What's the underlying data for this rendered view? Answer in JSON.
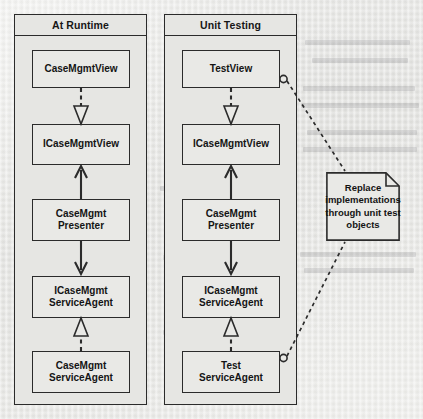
{
  "diagram": {
    "type": "uml-class-diagram",
    "background_color": "#ebebe8",
    "line_color": "#2b2b2b",
    "box_fill": "#e9e9e6",
    "packages": [
      {
        "id": "at-runtime",
        "title": "At Runtime",
        "classes": [
          {
            "id": "case-mgmt-view",
            "label": "CaseMgmtView"
          },
          {
            "id": "i-case-mgmt-view",
            "label": "ICaseMgmtView"
          },
          {
            "id": "case-mgmt-presenter",
            "label": "CaseMgmt\nPresenter"
          },
          {
            "id": "i-case-mgmt-service-agent",
            "label": "ICaseMgmt\nServiceAgent"
          },
          {
            "id": "case-mgmt-service-agent",
            "label": "CaseMgmt\nServiceAgent"
          }
        ],
        "connectors": [
          {
            "from": "case-mgmt-view",
            "to": "i-case-mgmt-view",
            "kind": "realization",
            "style": "dashed",
            "arrowhead": "hollow-triangle"
          },
          {
            "from": "case-mgmt-presenter",
            "to": "i-case-mgmt-view",
            "kind": "dependency",
            "style": "solid",
            "arrowhead": "open-arrow"
          },
          {
            "from": "case-mgmt-presenter",
            "to": "i-case-mgmt-service-agent",
            "kind": "dependency",
            "style": "solid",
            "arrowhead": "open-arrow"
          },
          {
            "from": "case-mgmt-service-agent",
            "to": "i-case-mgmt-service-agent",
            "kind": "realization",
            "style": "dashed",
            "arrowhead": "hollow-triangle"
          }
        ]
      },
      {
        "id": "unit-testing",
        "title": "Unit Testing",
        "classes": [
          {
            "id": "test-view",
            "label": "TestView"
          },
          {
            "id": "i-case-mgmt-view-2",
            "label": "ICaseMgmtView"
          },
          {
            "id": "case-mgmt-presenter-2",
            "label": "CaseMgmt\nPresenter"
          },
          {
            "id": "i-case-mgmt-service-agent-2",
            "label": "ICaseMgmt\nServiceAgent"
          },
          {
            "id": "test-service-agent",
            "label": "Test\nServiceAgent"
          }
        ],
        "connectors": [
          {
            "from": "test-view",
            "to": "i-case-mgmt-view-2",
            "kind": "realization",
            "style": "dashed",
            "arrowhead": "hollow-triangle"
          },
          {
            "from": "case-mgmt-presenter-2",
            "to": "i-case-mgmt-view-2",
            "kind": "dependency",
            "style": "solid",
            "arrowhead": "open-arrow"
          },
          {
            "from": "case-mgmt-presenter-2",
            "to": "i-case-mgmt-service-agent-2",
            "kind": "dependency",
            "style": "solid",
            "arrowhead": "open-arrow"
          },
          {
            "from": "test-service-agent",
            "to": "i-case-mgmt-service-agent-2",
            "kind": "realization",
            "style": "dashed",
            "arrowhead": "hollow-triangle"
          }
        ]
      }
    ],
    "note": {
      "id": "replace-implementations-note",
      "label": "Replace\nimplementations\nthrough unit test\nobjects",
      "anchors": [
        {
          "target": "test-view",
          "style": "dashed",
          "endpoint": "hollow-circle"
        },
        {
          "target": "test-service-agent",
          "style": "dashed",
          "endpoint": "hollow-circle"
        }
      ]
    }
  }
}
